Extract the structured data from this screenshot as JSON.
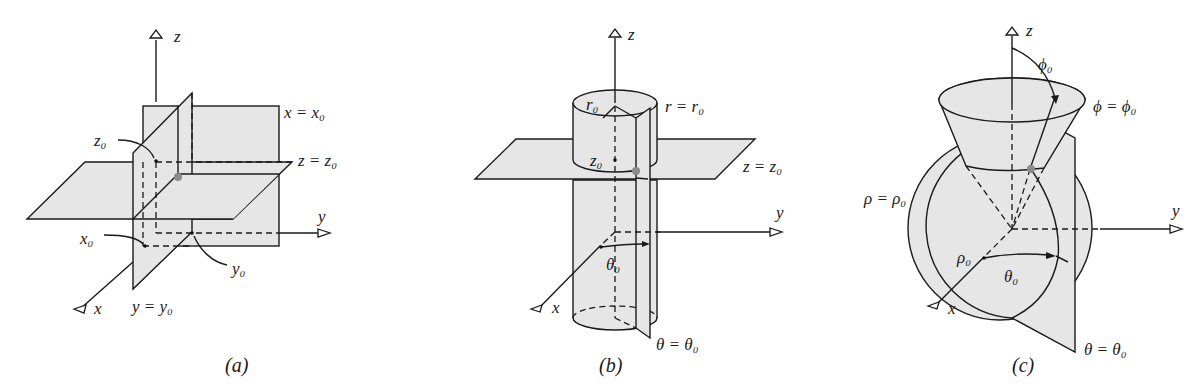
{
  "panels": [
    {
      "id": "a",
      "caption": "(a)",
      "title": "Rectangular coordinates",
      "axes": {
        "x": "x",
        "y": "y",
        "z": "z"
      },
      "surface_labels": {
        "x_plane": "x = x₀",
        "z_plane": "z = z₀",
        "y_plane": "y = y₀"
      },
      "point_labels": {
        "x0": "x₀",
        "y0": "y₀",
        "z0": "z₀"
      }
    },
    {
      "id": "b",
      "caption": "(b)",
      "title": "Cylindrical coordinates",
      "axes": {
        "x": "x",
        "y": "y",
        "z": "z"
      },
      "surface_labels": {
        "cylinder": "r = r₀",
        "z_plane": "z = z₀",
        "theta_plane": "θ = θ₀"
      },
      "point_labels": {
        "r0": "r₀",
        "z0": "z₀",
        "theta0": "θ₀"
      }
    },
    {
      "id": "c",
      "caption": "(c)",
      "title": "Spherical coordinates",
      "axes": {
        "x": "x",
        "y": "y",
        "z": "z"
      },
      "surface_labels": {
        "cone": "ϕ = ϕ₀",
        "sphere": "ρ = ρ₀",
        "theta_plane": "θ = θ₀"
      },
      "point_labels": {
        "phi0": "ϕ₀",
        "rho0": "ρ₀",
        "theta0": "θ₀"
      }
    }
  ],
  "colors": {
    "surface_fill": "#e6e6e6",
    "line": "#1a1a1a",
    "point": "#8a8a8a"
  }
}
